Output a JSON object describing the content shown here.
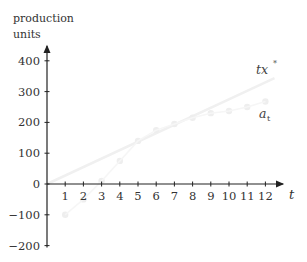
{
  "chart_data": {
    "type": "scatter",
    "title": "",
    "ylabel": "production units",
    "xlabel": "t",
    "x": [
      1,
      2,
      3,
      4,
      5,
      6,
      7,
      8,
      9,
      10,
      11,
      12
    ],
    "series": [
      {
        "name": "a_t",
        "kind": "points",
        "values": [
          -100,
          -50,
          10,
          75,
          140,
          175,
          195,
          215,
          230,
          237,
          250,
          268
        ]
      },
      {
        "name": "tx*",
        "kind": "line",
        "values": [
          27.5,
          55,
          82.5,
          110,
          137.5,
          165,
          192.5,
          220,
          247.5,
          275,
          302.5,
          330
        ]
      }
    ],
    "yticks": [
      -200,
      -100,
      0,
      100,
      200,
      300,
      400
    ],
    "xticks": [
      1,
      2,
      3,
      4,
      5,
      6,
      7,
      8,
      9,
      10,
      11,
      12
    ],
    "ylim": [
      -200,
      420
    ],
    "xlim": [
      0,
      13
    ],
    "grid": false,
    "annotations": [
      {
        "text": "tx*",
        "near": "line end"
      },
      {
        "text": "a_t",
        "near": "points end"
      }
    ]
  },
  "labels": {
    "ylabel_line1": "production",
    "ylabel_line2": "units",
    "xlabel": "t",
    "series_line": "tx",
    "series_line_sup": "*",
    "series_points": "a",
    "series_points_sub": "t"
  }
}
